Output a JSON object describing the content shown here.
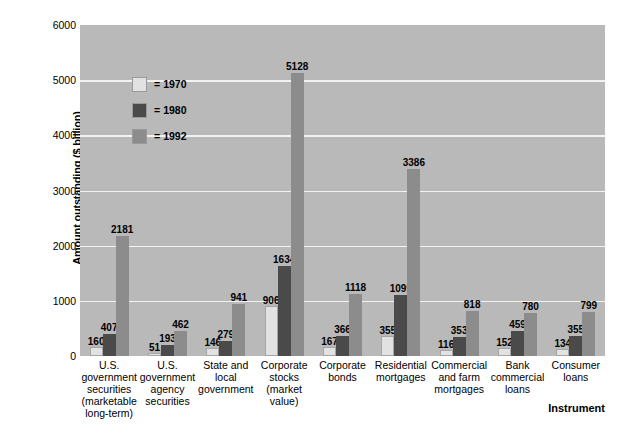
{
  "chart_data": {
    "type": "bar",
    "title": "",
    "xlabel": "Instrument",
    "ylabel": "Amount outstanding ($ billion)",
    "ylim": [
      0,
      6000
    ],
    "yticks": [
      0,
      1000,
      2000,
      3000,
      4000,
      5000,
      6000
    ],
    "grid": true,
    "legend_position": "inside-upper-left",
    "categories": [
      "U.S. government securities (marketable long-term)",
      "U.S. government agency securities",
      "State and local government",
      "Corporate stocks (market value)",
      "Corporate bonds",
      "Residential mortgages",
      "Commercial and farm mortgages",
      "Bank commercial loans",
      "Consumer loans"
    ],
    "category_lines": [
      [
        "U.S.",
        "government",
        "securities",
        "(marketable",
        "long-term)"
      ],
      [
        "U.S.",
        "government",
        "agency",
        "securities"
      ],
      [
        "State and",
        "local",
        "government"
      ],
      [
        "Corporate",
        "stocks",
        "(market",
        "value)"
      ],
      [
        "Corporate",
        "bonds"
      ],
      [
        "Residential",
        "mortgages"
      ],
      [
        "Commercial",
        "and farm",
        "mortgages"
      ],
      [
        "Bank",
        "commercial",
        "loans"
      ],
      [
        "Consumer",
        "loans"
      ]
    ],
    "series": [
      {
        "name": "1970",
        "color": "#e2e2e2",
        "values": [
          160,
          51,
          146,
          906,
          167,
          355,
          116,
          152,
          134
        ]
      },
      {
        "name": "1980",
        "color": "#4a4a4a",
        "values": [
          407,
          193,
          279,
          1634,
          366,
          1099,
          353,
          459,
          355
        ]
      },
      {
        "name": "1992",
        "color": "#8c8c8c",
        "values": [
          2181,
          462,
          941,
          5128,
          1118,
          3386,
          818,
          780,
          799
        ]
      }
    ]
  },
  "legend": {
    "equals": "=",
    "entries": [
      {
        "label": "1970"
      },
      {
        "label": "1980"
      },
      {
        "label": "1992"
      }
    ]
  },
  "colors": {
    "plot_background": "#b9b9b9",
    "gridline": "#f2f2f2",
    "page_background": "#ffffff",
    "text": "#000000"
  }
}
